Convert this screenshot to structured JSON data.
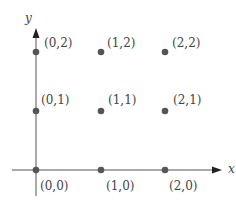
{
  "figure": {
    "axes": {
      "x_label": "x",
      "y_label": "y",
      "color": "#555555"
    },
    "point_color": "#555555",
    "points": [
      {
        "label": "(0,0)",
        "x": 0,
        "y": 0
      },
      {
        "label": "(1,0)",
        "x": 1,
        "y": 0
      },
      {
        "label": "(2,0)",
        "x": 2,
        "y": 0
      },
      {
        "label": "(0,1)",
        "x": 0,
        "y": 1
      },
      {
        "label": "(1,1)",
        "x": 1,
        "y": 1
      },
      {
        "label": "(2,1)",
        "x": 2,
        "y": 1
      },
      {
        "label": "(0,2)",
        "x": 0,
        "y": 2
      },
      {
        "label": "(1,2)",
        "x": 1,
        "y": 2
      },
      {
        "label": "(2,2)",
        "x": 2,
        "y": 2
      }
    ]
  }
}
